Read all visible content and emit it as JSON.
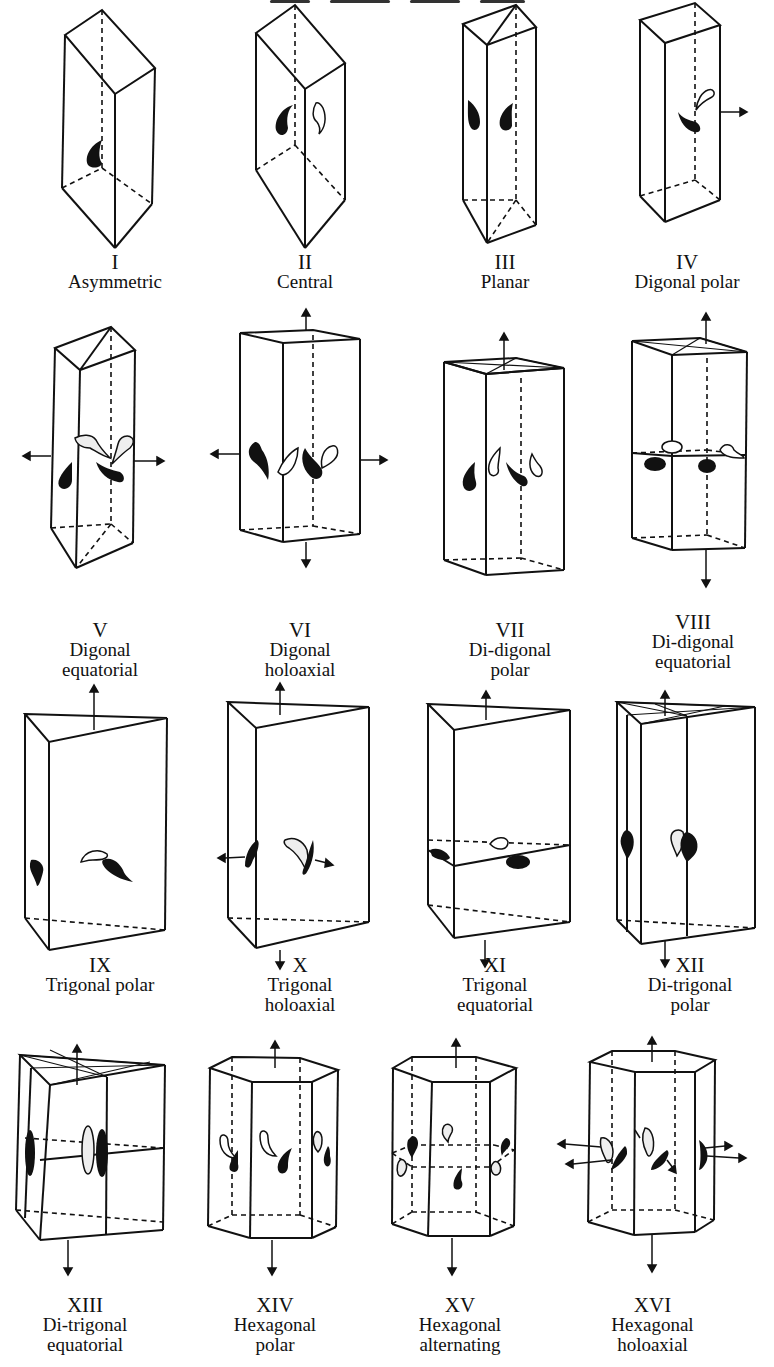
{
  "page": {
    "header_fragment": "(cut-off running header text)"
  },
  "figures": [
    {
      "numeral": "I",
      "name_lines": [
        "Asymmetric"
      ]
    },
    {
      "numeral": "II",
      "name_lines": [
        "Central"
      ]
    },
    {
      "numeral": "III",
      "name_lines": [
        "Planar"
      ]
    },
    {
      "numeral": "IV",
      "name_lines": [
        "Digonal polar"
      ]
    },
    {
      "numeral": "V",
      "name_lines": [
        "Digonal",
        "equatorial"
      ]
    },
    {
      "numeral": "VI",
      "name_lines": [
        "Digonal",
        "holoaxial"
      ]
    },
    {
      "numeral": "VII",
      "name_lines": [
        "Di-digonal",
        "polar"
      ]
    },
    {
      "numeral": "VIII",
      "name_lines": [
        "Di-digonal",
        "equatorial"
      ]
    },
    {
      "numeral": "IX",
      "name_lines": [
        "Trigonal polar"
      ]
    },
    {
      "numeral": "X",
      "name_lines": [
        "Trigonal",
        "holoaxial"
      ]
    },
    {
      "numeral": "XI",
      "name_lines": [
        "Trigonal",
        "equatorial"
      ]
    },
    {
      "numeral": "XII",
      "name_lines": [
        "Di-trigonal",
        "polar"
      ]
    },
    {
      "numeral": "XIII",
      "name_lines": [
        "Di-trigonal",
        "equatorial"
      ]
    },
    {
      "numeral": "XIV",
      "name_lines": [
        "Hexagonal",
        "polar"
      ]
    },
    {
      "numeral": "XV",
      "name_lines": [
        "Hexagonal",
        "alternating"
      ]
    },
    {
      "numeral": "XVI",
      "name_lines": [
        "Hexagonal",
        "holoaxial"
      ]
    }
  ]
}
